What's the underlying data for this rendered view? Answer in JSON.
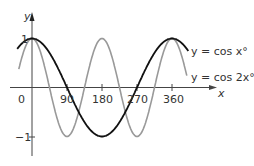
{
  "chart_data": {
    "type": "line",
    "title": "",
    "xlabel": "x",
    "ylabel": "y",
    "xlim": [
      -40,
      400
    ],
    "ylim": [
      -1.2,
      1.4
    ],
    "grid": false,
    "legend_position": "inline-right",
    "x_ticks": [
      {
        "value": 0,
        "label": "0"
      },
      {
        "value": 90,
        "label": "90"
      },
      {
        "value": 180,
        "label": "180"
      },
      {
        "value": 270,
        "label": "270"
      },
      {
        "value": 360,
        "label": "360"
      }
    ],
    "y_ticks": [
      {
        "value": 1,
        "label": "1"
      },
      {
        "value": -1,
        "label": "−1"
      }
    ],
    "series": [
      {
        "name": "y = cos x°",
        "function": "cos(x)",
        "color": "#111111",
        "x": [
          -40,
          0,
          90,
          180,
          270,
          360,
          400
        ],
        "values": [
          0.77,
          1,
          0,
          -1,
          0,
          1,
          0.77
        ]
      },
      {
        "name": "y = cos 2x°",
        "function": "cos(2x)",
        "color": "#999999",
        "x": [
          -40,
          0,
          45,
          90,
          135,
          180,
          225,
          270,
          315,
          360,
          400
        ],
        "values": [
          0.17,
          1,
          0,
          -1,
          0,
          1,
          0,
          -1,
          0,
          1,
          0.17
        ]
      }
    ]
  },
  "labels": {
    "origin": "0",
    "x_axis": "x",
    "y_axis": "y",
    "legend_cos_x": "y = cos x°",
    "legend_cos_2x": "y = cos 2x°",
    "tick_90": "90",
    "tick_180": "180",
    "tick_270": "270",
    "tick_360": "360",
    "tick_pos1": "1",
    "tick_neg1": "−1"
  }
}
